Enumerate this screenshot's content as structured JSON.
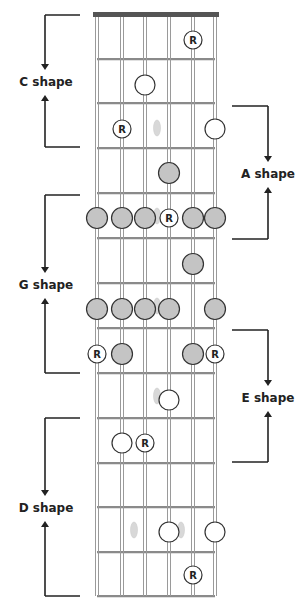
{
  "diagram": {
    "colors": {
      "nut": "#555555",
      "string": "#9a9a9a",
      "fret": "#8a8a8a",
      "filled_dot": "#c4c4c4",
      "dot_stroke": "#333333",
      "open_dot": "#ffffff",
      "ghost": "#d8d8d8",
      "bracket": "#222222"
    },
    "strings_x": [
      97,
      122,
      145,
      169,
      193,
      215
    ],
    "nut_y": 15,
    "fret_lines_y": [
      59,
      103,
      148,
      193,
      238,
      283,
      328,
      373,
      418,
      463,
      507,
      552,
      596
    ],
    "root_label": "R",
    "dots": [
      {
        "string": 5,
        "fret": 1,
        "x": 193,
        "y": 40,
        "type": "root"
      },
      {
        "string": 3,
        "fret": 2,
        "x": 145,
        "y": 85,
        "type": "open"
      },
      {
        "string": 2,
        "fret": 3,
        "x": 122,
        "y": 129,
        "type": "root"
      },
      {
        "string": 6,
        "fret": 3,
        "x": 215,
        "y": 129,
        "type": "open"
      },
      {
        "string": 4,
        "fret": 4,
        "x": 169,
        "y": 173,
        "type": "filled"
      },
      {
        "string": 1,
        "fret": 5,
        "x": 97,
        "y": 218,
        "type": "filled"
      },
      {
        "string": 2,
        "fret": 5,
        "x": 122,
        "y": 218,
        "type": "filled"
      },
      {
        "string": 3,
        "fret": 5,
        "x": 145,
        "y": 218,
        "type": "filled"
      },
      {
        "string": 4,
        "fret": 5,
        "x": 169,
        "y": 218,
        "type": "root"
      },
      {
        "string": 5,
        "fret": 5,
        "x": 193,
        "y": 218,
        "type": "filled"
      },
      {
        "string": 6,
        "fret": 5,
        "x": 215,
        "y": 218,
        "type": "filled"
      },
      {
        "string": 5,
        "fret": 6,
        "x": 193,
        "y": 264,
        "type": "filled"
      },
      {
        "string": 1,
        "fret": 7,
        "x": 97,
        "y": 309,
        "type": "filled"
      },
      {
        "string": 2,
        "fret": 7,
        "x": 122,
        "y": 309,
        "type": "filled"
      },
      {
        "string": 3,
        "fret": 7,
        "x": 145,
        "y": 309,
        "type": "filled"
      },
      {
        "string": 4,
        "fret": 7,
        "x": 169,
        "y": 309,
        "type": "filled"
      },
      {
        "string": 6,
        "fret": 7,
        "x": 215,
        "y": 309,
        "type": "filled"
      },
      {
        "string": 1,
        "fret": 8,
        "x": 97,
        "y": 354,
        "type": "root"
      },
      {
        "string": 2,
        "fret": 8,
        "x": 122,
        "y": 354,
        "type": "filled"
      },
      {
        "string": 5,
        "fret": 8,
        "x": 193,
        "y": 354,
        "type": "filled"
      },
      {
        "string": 6,
        "fret": 8,
        "x": 215,
        "y": 354,
        "type": "root"
      },
      {
        "string": 4,
        "fret": 9,
        "x": 169,
        "y": 400,
        "type": "open"
      },
      {
        "string": 2,
        "fret": 10,
        "x": 122,
        "y": 443,
        "type": "open"
      },
      {
        "string": 3,
        "fret": 10,
        "x": 145,
        "y": 443,
        "type": "root"
      },
      {
        "string": 4,
        "fret": 12,
        "x": 169,
        "y": 532,
        "type": "open"
      },
      {
        "string": 6,
        "fret": 12,
        "x": 215,
        "y": 532,
        "type": "open"
      },
      {
        "string": 5,
        "fret": 13,
        "x": 193,
        "y": 575,
        "type": "root"
      }
    ],
    "ghost_markers": [
      {
        "x": 157,
        "y": 128
      },
      {
        "x": 157,
        "y": 216
      },
      {
        "x": 157,
        "y": 306
      },
      {
        "x": 157,
        "y": 396
      },
      {
        "x": 134,
        "y": 530
      },
      {
        "x": 181,
        "y": 530
      }
    ],
    "shapes": [
      {
        "name": "C shape",
        "side": "left",
        "top": 15,
        "bottom": 147,
        "label_y": 86
      },
      {
        "name": "A shape",
        "side": "right",
        "top": 106,
        "bottom": 239,
        "label_y": 178
      },
      {
        "name": "G shape",
        "side": "left",
        "top": 195,
        "bottom": 373,
        "label_y": 289
      },
      {
        "name": "E shape",
        "side": "right",
        "top": 330,
        "bottom": 462,
        "label_y": 402
      },
      {
        "name": "D shape",
        "side": "left",
        "top": 418,
        "bottom": 596,
        "label_y": 512
      }
    ]
  }
}
